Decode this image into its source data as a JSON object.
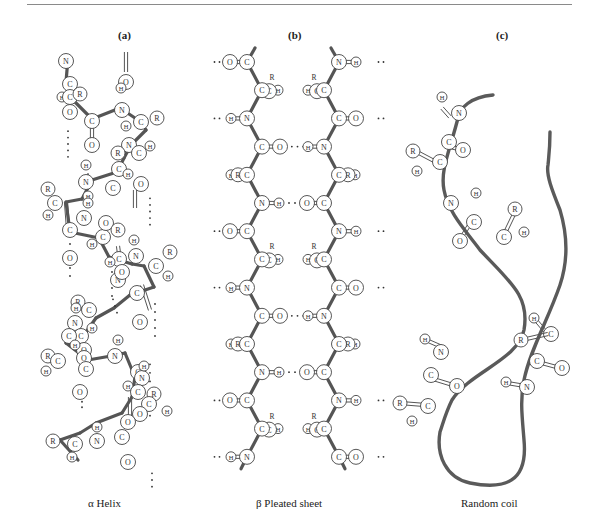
{
  "figure": {
    "panels": [
      {
        "id": "a",
        "label": "(a)",
        "caption": "α Helix"
      },
      {
        "id": "b",
        "label": "(b)",
        "caption": "β Pleated sheet"
      },
      {
        "id": "c",
        "label": "(c)",
        "caption": "Random coil"
      }
    ],
    "atom_labels": {
      "carbon": "C",
      "nitrogen": "N",
      "oxygen": "O",
      "hydrogen": "H",
      "side_chain": "R"
    },
    "colors": {
      "backbone": "#555555",
      "atom_stroke": "#444444",
      "atom_fill": "#ffffff",
      "rule": "#8a8a8a"
    }
  }
}
